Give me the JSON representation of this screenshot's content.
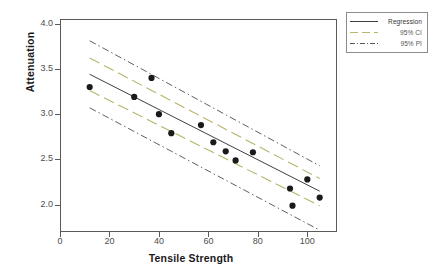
{
  "chart_data": {
    "type": "scatter",
    "title": "",
    "xlabel": "Tensile Strength",
    "ylabel": "Attenuation",
    "xlim": [
      0,
      112
    ],
    "ylim": [
      1.7,
      4.05
    ],
    "xticks": [
      0,
      20,
      40,
      60,
      80,
      100
    ],
    "yticks": [
      4.0,
      3.5,
      3.0,
      2.5,
      2.0
    ],
    "xtick_labels": [
      "0",
      "20",
      "40",
      "60",
      "80",
      "100"
    ],
    "ytick_labels": [
      "4.0",
      "3.5",
      "3.0",
      "2.5",
      "2.0"
    ],
    "grid": false,
    "legend_position": "outside-top-right",
    "points": [
      {
        "x": 12,
        "y": 3.3
      },
      {
        "x": 30,
        "y": 3.19
      },
      {
        "x": 37,
        "y": 3.4
      },
      {
        "x": 40,
        "y": 3.0
      },
      {
        "x": 45,
        "y": 2.79
      },
      {
        "x": 57,
        "y": 2.88
      },
      {
        "x": 62,
        "y": 2.69
      },
      {
        "x": 67,
        "y": 2.59
      },
      {
        "x": 71,
        "y": 2.49
      },
      {
        "x": 78,
        "y": 2.58
      },
      {
        "x": 93,
        "y": 2.18
      },
      {
        "x": 94,
        "y": 1.99
      },
      {
        "x": 100,
        "y": 2.28
      },
      {
        "x": 105,
        "y": 2.08
      }
    ],
    "regression": {
      "name": "Regression",
      "style": "solid",
      "x_start": 12,
      "x_end": 105,
      "y_start": 3.44,
      "y_end": 2.15
    },
    "ci_upper": {
      "name": "95% CI upper",
      "style": "dashed",
      "x_start": 12,
      "x_end": 105,
      "y_start": 3.62,
      "y_end": 2.29
    },
    "ci_lower": {
      "name": "95% CI lower",
      "style": "dashed",
      "x_start": 12,
      "x_end": 105,
      "y_start": 3.26,
      "y_end": 1.99
    },
    "pi_upper": {
      "name": "95% PI upper",
      "style": "dash-dot",
      "x_start": 12,
      "x_end": 105,
      "y_start": 3.81,
      "y_end": 2.43
    },
    "pi_lower": {
      "name": "95% PI lower",
      "style": "dash-dot",
      "x_start": 12,
      "x_end": 105,
      "y_start": 3.07,
      "y_end": 1.72
    },
    "series_colors": {
      "regression": "#3f3f3f",
      "ci": "#b5b56b",
      "pi": "#4d4d4d",
      "points": "#1a1a1a"
    }
  },
  "legend": {
    "items": [
      {
        "label": "Regression",
        "style": "solid"
      },
      {
        "label": "95% CI",
        "style": "dashed"
      },
      {
        "label": "95% PI",
        "style": "dash-dot"
      }
    ]
  }
}
